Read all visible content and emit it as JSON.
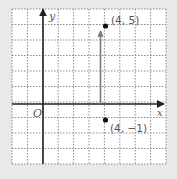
{
  "figure": {
    "type": "coordinate-plane",
    "grid": {
      "cols": 10,
      "rows": 10,
      "x_min": -2,
      "x_max": 8,
      "y_min": -4,
      "y_max": 6,
      "style": "dotted"
    },
    "axes": {
      "x_label": "x",
      "y_label": "y",
      "origin_label": "O"
    },
    "points": [
      {
        "x": 4,
        "y": 5,
        "label": "(4, 5)"
      },
      {
        "x": 4,
        "y": -1,
        "label": "(4, −1)"
      }
    ],
    "arrow": {
      "from": [
        4,
        0
      ],
      "to": [
        4,
        5
      ],
      "color": "#7a7a7a"
    },
    "colors": {
      "background": "#e9e9e9",
      "grid_bg": "#ffffff",
      "grid_line": "#8a8a8a",
      "axis": "#222222",
      "point": "#111111"
    }
  },
  "chart_data": {
    "type": "scatter",
    "title": "",
    "xlabel": "x",
    "ylabel": "y",
    "xlim": [
      -2,
      8
    ],
    "ylim": [
      -4,
      6
    ],
    "grid": true,
    "series": [
      {
        "name": "points",
        "x": [
          4,
          4
        ],
        "y": [
          5,
          -1
        ],
        "labels": [
          "(4, 5)",
          "(4, −1)"
        ]
      }
    ],
    "annotations": [
      "O",
      "vertical arrow from (4,0) to (4,5)"
    ]
  }
}
